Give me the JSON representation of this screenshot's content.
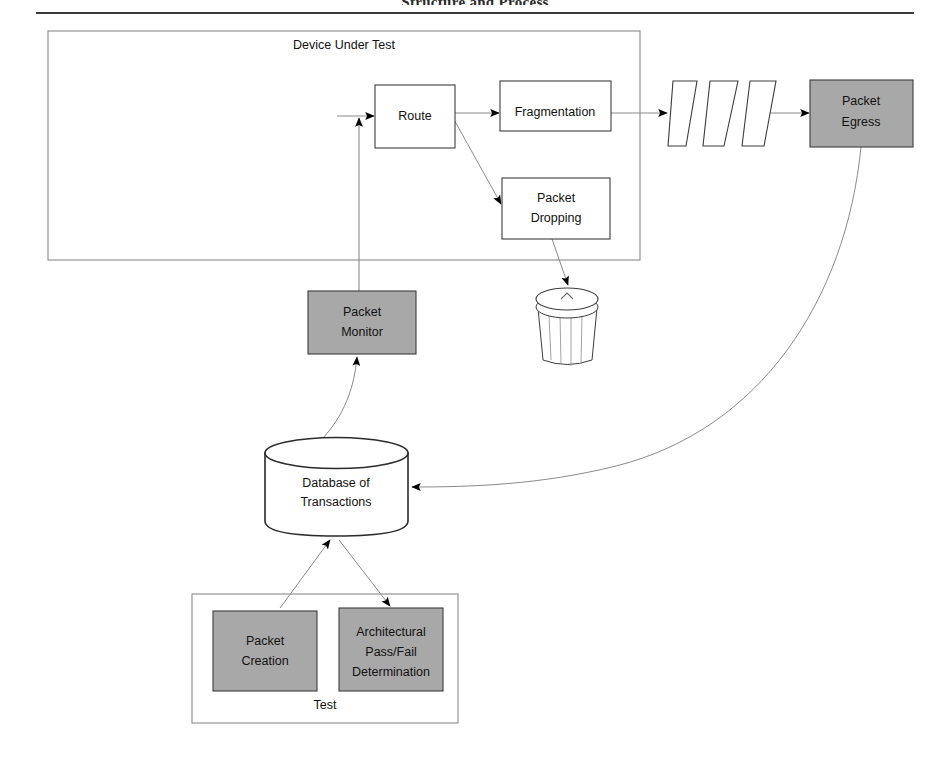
{
  "page": {
    "title": "Structure and Process",
    "background": "#ffffff"
  },
  "colors": {
    "gray_fill": "#a8a8a8",
    "shape_stroke": "#3c3c3c",
    "thin_stroke": "#8a8a8a",
    "arrow_black": "#000000",
    "text": "#111111"
  },
  "diagram": {
    "type": "flow-diagram",
    "groups": [
      {
        "id": "device-under-test",
        "label": "Device Under Test",
        "x": 48,
        "y": 31,
        "w": 592,
        "h": 229,
        "fill": "none",
        "label_x": 344,
        "label_y": 46
      },
      {
        "id": "test",
        "label": "Test",
        "x": 192,
        "y": 594,
        "w": 266,
        "h": 129,
        "fill": "none",
        "label_x": 325,
        "label_y": 706
      }
    ],
    "nodes": [
      {
        "id": "route",
        "label": "Route",
        "shape": "rect",
        "fill": "white",
        "x": 375,
        "y": 85,
        "w": 80,
        "h": 63,
        "lines": [
          "Route"
        ]
      },
      {
        "id": "fragmentation",
        "label": "Fragmentation",
        "shape": "rect",
        "fill": "white",
        "x": 500,
        "y": 81,
        "w": 111,
        "h": 50,
        "lines": [
          "Fragmentation"
        ]
      },
      {
        "id": "packet-dropping",
        "label": "Packet Dropping",
        "shape": "rect",
        "fill": "white",
        "x": 502,
        "y": 178,
        "w": 108,
        "h": 61,
        "lines": [
          "Packet",
          "Dropping"
        ]
      },
      {
        "id": "packet-egress",
        "label": "Packet Egress",
        "shape": "rect",
        "fill": "gray",
        "x": 810,
        "y": 80,
        "w": 103,
        "h": 67,
        "lines": [
          "Packet",
          "Egress"
        ]
      },
      {
        "id": "packet-monitor",
        "label": "Packet Monitor",
        "shape": "rect",
        "fill": "gray",
        "x": 308,
        "y": 291,
        "w": 108,
        "h": 63,
        "lines": [
          "Packet",
          "Monitor"
        ]
      },
      {
        "id": "packet-creation",
        "label": "Packet Creation",
        "shape": "rect",
        "fill": "gray",
        "x": 213,
        "y": 611,
        "w": 104,
        "h": 80,
        "lines": [
          "Packet",
          "Creation"
        ]
      },
      {
        "id": "architectural-pass-fail-determination",
        "label": "Architectural Pass/Fail Determination",
        "shape": "rect",
        "fill": "gray",
        "x": 339,
        "y": 608,
        "w": 104,
        "h": 83,
        "lines": [
          "Architectural",
          "Pass/Fail",
          "Determination"
        ]
      },
      {
        "id": "database-of-transactions",
        "label": "Database of Transactions",
        "shape": "cylinder",
        "fill": "white",
        "x": 265,
        "y": 438,
        "w": 143,
        "h": 98,
        "lines": [
          "Database of",
          "Transactions"
        ]
      },
      {
        "id": "trash-can",
        "label": "trash-can",
        "shape": "trash",
        "fill": "white",
        "x": 531,
        "y": 288,
        "w": 72,
        "h": 79,
        "lines": []
      },
      {
        "id": "packet-stream",
        "label": "packets-in-flight",
        "shape": "parallelogram-group",
        "count": 3,
        "fill": "white",
        "x": 668,
        "y": 81,
        "w": 96,
        "h": 65,
        "lines": []
      }
    ],
    "edges": [
      {
        "id": "ingress-to-route",
        "from": "ingress",
        "to": "route",
        "style": "straight-arrow"
      },
      {
        "id": "route-to-fragmentation",
        "from": "route",
        "to": "fragmentation",
        "style": "straight-arrow"
      },
      {
        "id": "route-to-packet-dropping",
        "from": "route",
        "to": "packet-dropping",
        "style": "diagonal-arrow"
      },
      {
        "id": "fragmentation-to-packet-stream",
        "from": "fragmentation",
        "to": "packet-stream",
        "style": "straight-arrow"
      },
      {
        "id": "packet-stream-to-packet-egress",
        "from": "packet-stream",
        "to": "packet-egress",
        "style": "straight-arrow"
      },
      {
        "id": "packet-dropping-to-trash-can",
        "from": "packet-dropping",
        "to": "trash-can",
        "style": "diagonal-arrow"
      },
      {
        "id": "packet-monitor-to-route",
        "from": "packet-monitor",
        "to": "route",
        "style": "vertical-arrow"
      },
      {
        "id": "database-to-packet-monitor",
        "from": "database-of-transactions",
        "to": "packet-monitor",
        "style": "curved-arrow"
      },
      {
        "id": "packet-egress-to-database",
        "from": "packet-egress",
        "to": "database-of-transactions",
        "style": "long-curved-arrow"
      },
      {
        "id": "packet-creation-to-database",
        "from": "packet-creation",
        "to": "database-of-transactions",
        "style": "diagonal-arrow"
      },
      {
        "id": "database-to-pass-fail",
        "from": "database-of-transactions",
        "to": "architectural-pass-fail-determination",
        "style": "diagonal-arrow"
      }
    ]
  }
}
